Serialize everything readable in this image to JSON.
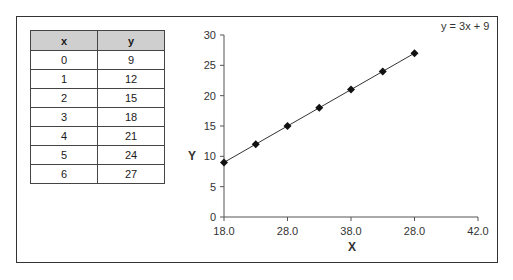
{
  "table": {
    "headers": [
      "x",
      "y"
    ],
    "rows": [
      [
        "0",
        "9"
      ],
      [
        "1",
        "12"
      ],
      [
        "2",
        "15"
      ],
      [
        "3",
        "18"
      ],
      [
        "4",
        "21"
      ],
      [
        "5",
        "24"
      ],
      [
        "6",
        "27"
      ]
    ]
  },
  "chart_data": {
    "type": "line",
    "title": "",
    "xlabel": "X",
    "ylabel": "Y",
    "x": [
      0,
      1,
      2,
      3,
      4,
      5,
      6
    ],
    "series": [
      {
        "name": "y = 3x + 9",
        "values": [
          9,
          12,
          15,
          18,
          21,
          24,
          27
        ]
      }
    ],
    "x_tick_labels": [
      "18.0",
      "28.0",
      "38.0",
      "28.0",
      "42.0"
    ],
    "y_ticks": [
      0,
      5,
      10,
      15,
      20,
      25,
      30
    ],
    "ylim": [
      0,
      30
    ],
    "annotations": [
      "y = 3x + 9"
    ],
    "grid": false,
    "legend": "none",
    "marker": "diamond",
    "line_color": "#333333"
  }
}
